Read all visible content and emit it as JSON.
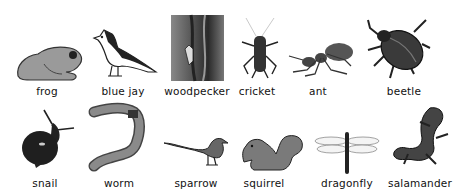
{
  "rows": [
    {
      "animals": [
        {
          "name": "frog",
          "icon": "frog-icon"
        },
        {
          "name": "blue jay",
          "icon": "blue-jay-icon"
        },
        {
          "name": "woodpecker",
          "icon": "woodpecker-photo"
        },
        {
          "name": "cricket",
          "icon": "cricket-icon"
        },
        {
          "name": "ant",
          "icon": "ant-icon"
        },
        {
          "name": "beetle",
          "icon": "beetle-icon"
        }
      ]
    },
    {
      "animals": [
        {
          "name": "snail",
          "icon": "snail-icon"
        },
        {
          "name": "worm",
          "icon": "worm-icon"
        },
        {
          "name": "sparrow",
          "icon": "sparrow-icon"
        },
        {
          "name": "squirrel",
          "icon": "squirrel-icon"
        },
        {
          "name": "dragonfly",
          "icon": "dragonfly-icon"
        },
        {
          "name": "salamander",
          "icon": "salamander-icon"
        }
      ]
    }
  ]
}
